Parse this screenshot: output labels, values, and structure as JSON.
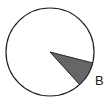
{
  "diagram": {
    "type": "circle-sector",
    "circle": {
      "cx": 50,
      "cy": 52,
      "r": 44,
      "stroke": "#222222",
      "fill": "#ffffff"
    },
    "sector": {
      "label": "B",
      "fill": "#666666",
      "stroke": "#222222",
      "start_point": [
        93,
        63
      ],
      "end_point": [
        80,
        85
      ]
    },
    "labels": [
      {
        "text": "B",
        "x": 95,
        "y": 85
      }
    ]
  }
}
